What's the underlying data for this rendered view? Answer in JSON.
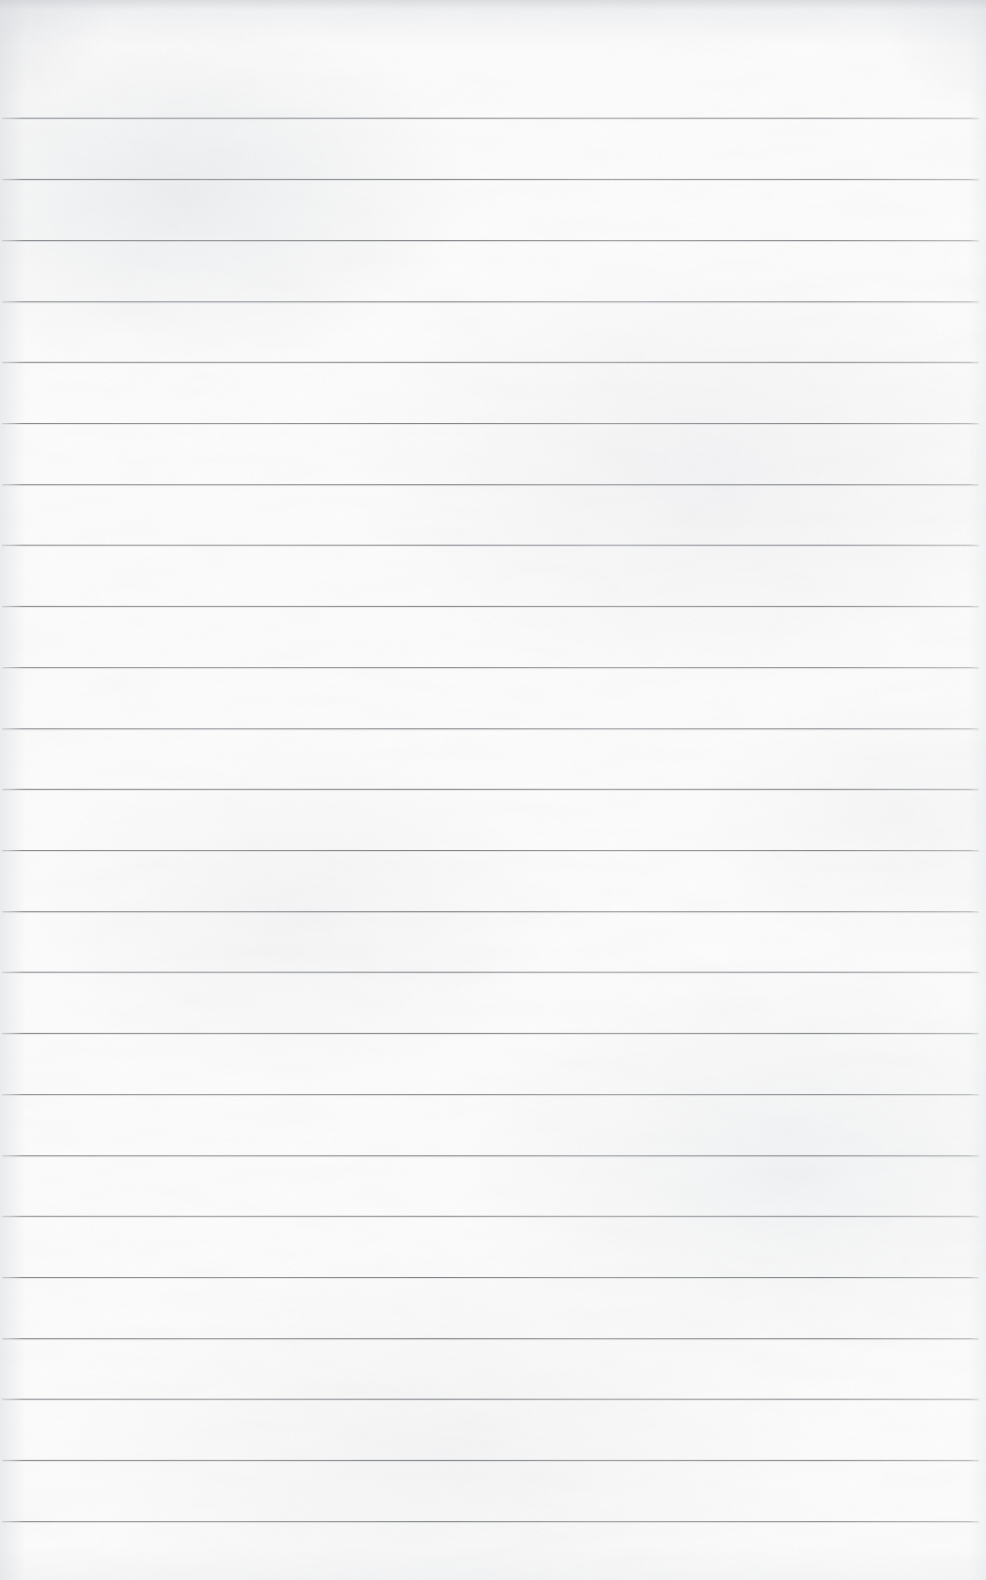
{
  "document": {
    "kind": "scanned-lined-paper",
    "title": "Blank Ruled Notebook Page",
    "description": "A scanned blank sheet of ruled writing paper with horizontal rules and no handwriting or printed text.",
    "page_width_px": 986,
    "page_height_px": 1580,
    "orientation": "portrait",
    "has_text_content": false,
    "handwriting_present": false,
    "margin_rule_present": false,
    "holes_punched": false
  },
  "colors": {
    "paper": "#fdfdfd",
    "paper_shade": "#f2f3f5",
    "rule_line": "#767a7f",
    "rule_line_light": "#9a9da2",
    "edge_shadow": "#cdcfd3"
  },
  "ruling": {
    "style": "wide-ruled",
    "line_count": 24,
    "first_line_y": 118,
    "line_spacing_px": 61,
    "line_thickness_px": 1,
    "line_start_x": 2,
    "line_end_x": 979,
    "top_margin_px": 118,
    "bottom_margin_px": 58,
    "lines_y": [
      118,
      179,
      240,
      301,
      362,
      423,
      484,
      545,
      606,
      667,
      728,
      789,
      850,
      911,
      972,
      1033,
      1094,
      1155,
      1216,
      1277,
      1338,
      1399,
      1460,
      1521
    ]
  }
}
